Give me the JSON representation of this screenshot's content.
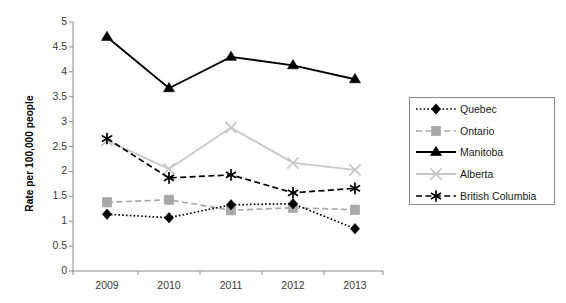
{
  "chart_data": {
    "type": "line",
    "title": "",
    "xlabel": "",
    "ylabel": "Rate per 100,000 people",
    "categories": [
      "2009",
      "2010",
      "2011",
      "2012",
      "2013"
    ],
    "x_tick_labels": [
      "2009",
      "2010",
      "2011",
      "2012",
      "2013"
    ],
    "y_tick_labels": [
      "0",
      "0.5",
      "1",
      "1.5",
      "2",
      "2.5",
      "3",
      "3.5",
      "4",
      "4.5",
      "5"
    ],
    "y_tick_values": [
      0,
      0.5,
      1,
      1.5,
      2,
      2.5,
      3,
      3.5,
      4,
      4.5,
      5
    ],
    "ylim": [
      0,
      5
    ],
    "grid": false,
    "legend_position": "right",
    "series": [
      {
        "name": "Quebec",
        "values": [
          1.14,
          1.07,
          1.33,
          1.35,
          0.85
        ],
        "color": "#000000",
        "marker": "diamond",
        "line_style": "dotted"
      },
      {
        "name": "Ontario",
        "values": [
          1.38,
          1.43,
          1.22,
          1.27,
          1.23
        ],
        "color": "#a8a8a8",
        "marker": "square",
        "line_style": "dashed"
      },
      {
        "name": "Manitoba",
        "values": [
          4.7,
          3.67,
          4.3,
          4.13,
          3.85
        ],
        "color": "#000000",
        "marker": "triangle",
        "line_style": "solid"
      },
      {
        "name": "Alberta",
        "values": [
          2.62,
          2.05,
          2.88,
          2.17,
          2.03
        ],
        "color": "#c9c9c9",
        "marker": "x",
        "line_style": "solid"
      },
      {
        "name": "British Columbia",
        "values": [
          2.66,
          1.87,
          1.93,
          1.57,
          1.66
        ],
        "color": "#000000",
        "marker": "asterisk",
        "line_style": "dashed"
      }
    ]
  },
  "axes": {
    "axis_color": "#8a8a8a",
    "label_color": "#3a3a3a"
  },
  "legend": {
    "border_color": "#8a8a8a",
    "entries": [
      {
        "label": "Quebec"
      },
      {
        "label": "Ontario"
      },
      {
        "label": "Manitoba"
      },
      {
        "label": "Alberta"
      },
      {
        "label": "British Columbia"
      }
    ]
  }
}
